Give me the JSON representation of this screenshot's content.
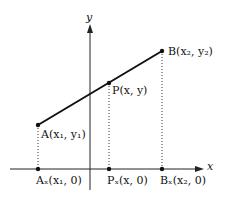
{
  "diagram": {
    "title": "",
    "axes": {
      "x_label": "x",
      "y_label": "y"
    },
    "points": {
      "A": {
        "label": "A(x₁, y₁)"
      },
      "P": {
        "label": "P(x, y)"
      },
      "B": {
        "label": "B(x₂, y₂)"
      },
      "Ax": {
        "label": "Aₓ(x₁, 0)"
      },
      "Px": {
        "label": "Pₓ(x, 0)"
      },
      "Bx": {
        "label": "Bₓ(x₂, 0)"
      }
    },
    "colors": {
      "line": "#111111",
      "background": "#ffffff"
    }
  }
}
